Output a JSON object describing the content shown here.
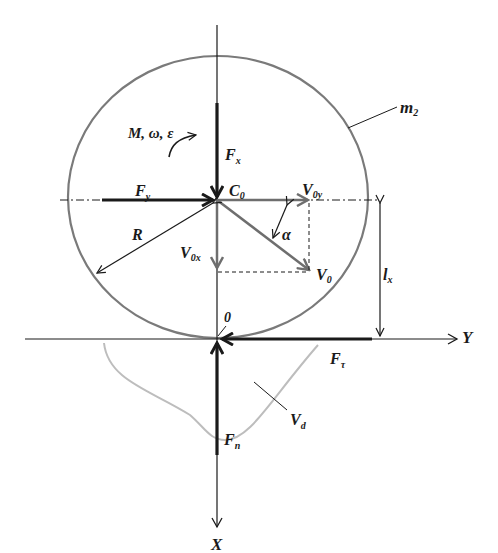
{
  "diagram": {
    "type": "free-body-diagram",
    "colors": {
      "ink": "#1a1a1a",
      "circle": "#7a7a7a",
      "velocity": "#6e6e6e",
      "deformation": "#bdbdbd"
    },
    "labels": {
      "moment": "M, ω, ε",
      "fx_main": "F",
      "fx_sub": "x",
      "fy_main": "F",
      "fy_sub": "y",
      "c0_main": "C",
      "c0_sub": "0",
      "v0y_main": "V",
      "v0y_sub": "0y",
      "v0x_main": "V",
      "v0x_sub": "0x",
      "v0_main": "V",
      "v0_sub": "0",
      "alpha": "α",
      "radius": "R",
      "mass_main": "m",
      "mass_sub": "2",
      "lx_main": "l",
      "lx_sub": "x",
      "origin": "0",
      "y_axis": "Y",
      "x_axis": "X",
      "ftau_main": "F",
      "ftau_sub": "τ",
      "fn_main": "F",
      "fn_sub": "n",
      "vd_main": "V",
      "vd_sub": "d"
    }
  }
}
